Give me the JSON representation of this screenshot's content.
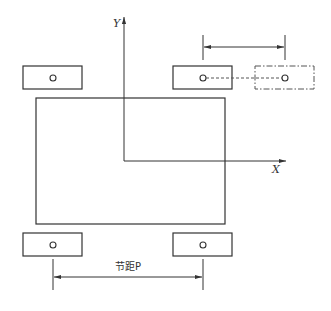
{
  "diagram": {
    "type": "engineering-layout",
    "axes": {
      "y_label": "Y",
      "x_label": "X"
    },
    "dimensions": {
      "bottom_label": "节距P",
      "top_label": ""
    },
    "components": [
      {
        "name": "pad-top-left",
        "style": "solid",
        "has_hole": true
      },
      {
        "name": "pad-top-right",
        "style": "solid",
        "has_hole": true
      },
      {
        "name": "pad-top-right-shifted",
        "style": "dash-dot",
        "has_hole": true
      },
      {
        "name": "pad-bottom-left",
        "style": "solid",
        "has_hole": true
      },
      {
        "name": "pad-bottom-right",
        "style": "solid",
        "has_hole": true
      },
      {
        "name": "main-body",
        "style": "solid",
        "has_hole": false
      }
    ],
    "colors": {
      "line": "#333333",
      "dashed": "#555555",
      "background": "#ffffff"
    }
  }
}
